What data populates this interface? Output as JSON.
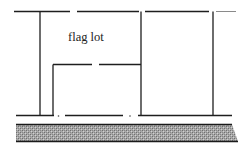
{
  "diagram": {
    "title": "",
    "labels": {
      "flag_lot": "flag lot"
    },
    "elements": [
      {
        "id": "top-boundary",
        "kind": "lot-line"
      },
      {
        "id": "bottom-boundary",
        "kind": "lot-line"
      },
      {
        "id": "left-lot-line",
        "kind": "lot-line"
      },
      {
        "id": "middle-lot-line",
        "kind": "lot-line"
      },
      {
        "id": "right-lot-line",
        "kind": "lot-line"
      },
      {
        "id": "flag-lot-rear-line",
        "kind": "lot-line"
      },
      {
        "id": "flag-pole-line",
        "kind": "lot-line"
      },
      {
        "id": "street",
        "kind": "hatched-band"
      }
    ],
    "colors": {
      "line": "#1e1e1e",
      "street_fill": "#9a9a9a",
      "street_dither_dark": "#6f6f6f",
      "street_dither_light": "#d0d0d0",
      "background": "#ffffff"
    }
  }
}
